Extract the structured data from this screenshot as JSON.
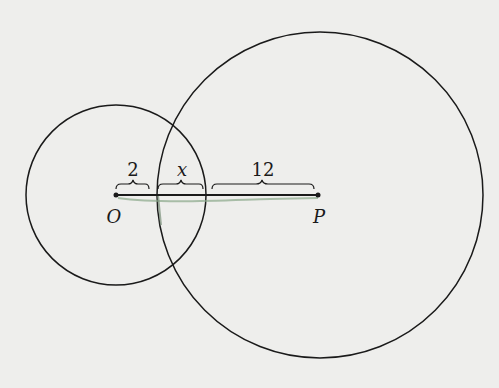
{
  "diagram": {
    "circle_small": {
      "center_label": "O",
      "cx": 116,
      "cy": 195,
      "r": 90
    },
    "circle_large": {
      "center_label": "P",
      "cx": 318,
      "cy": 195,
      "r": 163
    },
    "segment_labels": {
      "left": "2",
      "middle": "x",
      "right": "12"
    },
    "point_labels": {
      "O": "O",
      "P": "P"
    },
    "colors": {
      "background": "#eeeeec",
      "stroke": "#1a1a1a",
      "highlight": "#6f8f6f"
    }
  }
}
